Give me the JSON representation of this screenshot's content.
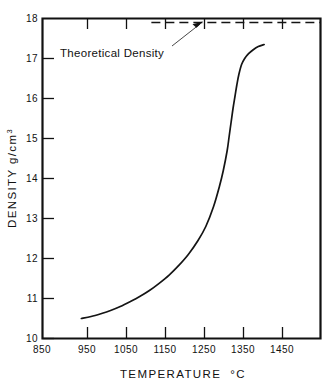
{
  "figure": {
    "background_color": "#ffffff",
    "ink_color": "#111111"
  },
  "chart_data": {
    "type": "line",
    "title": "",
    "xlabel": "TEMPERATURE  °C",
    "ylabel": "DENSITY  g/cm³",
    "ylabel_main": "DENSITY  g/cm",
    "ylabel_superscript": "3",
    "xlabel_main": "TEMPERATURE",
    "xlabel_units": "°C",
    "xlim": [
      850,
      1565
    ],
    "ylim": [
      10,
      18
    ],
    "xticks": [
      850,
      950,
      1050,
      1150,
      1250,
      1350,
      1450
    ],
    "xtick_labels": [
      "850",
      "950",
      "1050",
      "1150",
      "1250",
      "1350",
      "1450"
    ],
    "yticks": [
      10,
      11,
      12,
      13,
      14,
      15,
      16,
      17,
      18
    ],
    "ytick_labels": [
      "10",
      "11",
      "12",
      "13",
      "14",
      "15",
      "16",
      "17",
      "18"
    ],
    "grid": false,
    "legend": false,
    "series": [
      {
        "name": "Sintered density vs temperature",
        "style": "solid",
        "x": [
          950,
          975,
          1000,
          1025,
          1050,
          1075,
          1100,
          1125,
          1150,
          1175,
          1200,
          1225,
          1250,
          1270,
          1290,
          1305,
          1315,
          1325,
          1330,
          1335,
          1340,
          1345,
          1350,
          1355,
          1362,
          1370,
          1380,
          1392,
          1405,
          1420
        ],
        "y": [
          10.5,
          10.55,
          10.62,
          10.7,
          10.8,
          10.92,
          11.05,
          11.2,
          11.38,
          11.58,
          11.82,
          12.1,
          12.45,
          12.8,
          13.3,
          13.8,
          14.2,
          14.7,
          15.05,
          15.4,
          15.75,
          16.05,
          16.35,
          16.6,
          16.85,
          17.0,
          17.12,
          17.22,
          17.3,
          17.35
        ]
      }
    ],
    "reference_lines": [
      {
        "name": "theoretical-density",
        "label": "Theoretical Density",
        "orientation": "horizontal",
        "value": 17.9,
        "style": "dashed",
        "x_start": 1130,
        "x_end": 1565
      }
    ],
    "annotations": [
      {
        "name": "theoretical-density-annotation",
        "text": "Theoretical Density",
        "text_x": 960,
        "text_y": 17.45,
        "arrow_target_x": 1262,
        "arrow_target_y": 17.9
      }
    ]
  }
}
